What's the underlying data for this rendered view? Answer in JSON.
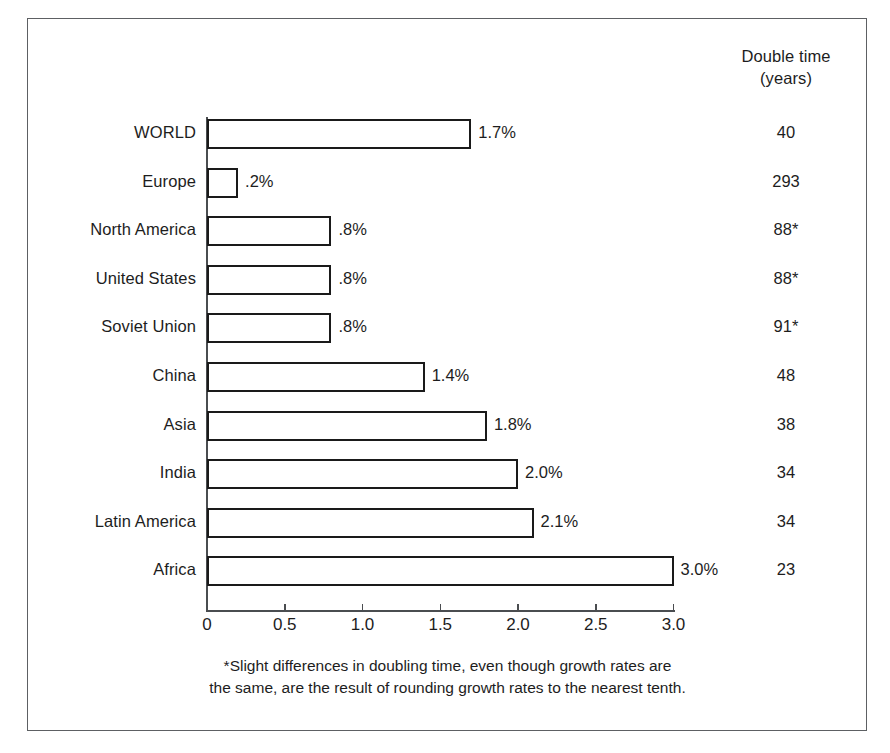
{
  "figure": {
    "right_column_header_line1": "Double time",
    "right_column_header_line2": "(years)",
    "footnote_line1": "*Slight differences in doubling time, even though growth rates are",
    "footnote_line2": "the same, are the result of rounding growth rates to the nearest tenth.",
    "border_color": "#5d6063",
    "bar_outline_color": "#1a1a1a",
    "bar_fill_color": "#ffffff",
    "text_color": "#1d1d1d"
  },
  "chart_data": {
    "type": "bar",
    "orientation": "horizontal",
    "title": "",
    "xlabel": "",
    "ylabel": "",
    "xlim": [
      0,
      3.0
    ],
    "grid": false,
    "legend": null,
    "xticks": [
      0,
      0.5,
      1.0,
      1.5,
      2.0,
      2.5,
      3.0
    ],
    "xticklabels": [
      "0",
      "0.5",
      "1.0",
      "1.5",
      "2.0",
      "2.5",
      "3.0"
    ],
    "categories": [
      "WORLD",
      "Europe",
      "North America",
      "United States",
      "Soviet Union",
      "China",
      "Asia",
      "India",
      "Latin America",
      "Africa"
    ],
    "values": [
      1.7,
      0.2,
      0.8,
      0.8,
      0.8,
      1.4,
      1.8,
      2.0,
      2.1,
      3.0
    ],
    "value_labels": [
      "1.7%",
      ".2%",
      ".8%",
      ".8%",
      ".8%",
      "1.4%",
      "1.8%",
      "2.0%",
      "2.1%",
      "3.0%"
    ],
    "double_time_years": [
      "40",
      "293",
      "88*",
      "88*",
      "91*",
      "48",
      "38",
      "34",
      "34",
      "23"
    ],
    "annotations": [
      "*Slight differences in doubling time, even though growth rates are the same, are the result of rounding growth rates to the nearest tenth."
    ]
  }
}
